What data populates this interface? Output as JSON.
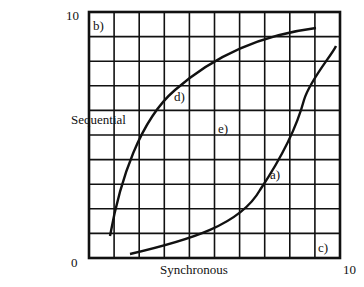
{
  "axes": {
    "y_label": "Sequential",
    "x_label": "Synchronous",
    "y_max_tick": "10",
    "x_max_tick": "10",
    "origin_tick": "0"
  },
  "grid": {
    "columns": 10,
    "rows": 10
  },
  "curve_labels": {
    "a": "a)",
    "b": "b)",
    "c": "c)",
    "d": "d)",
    "e": "e)"
  }
}
